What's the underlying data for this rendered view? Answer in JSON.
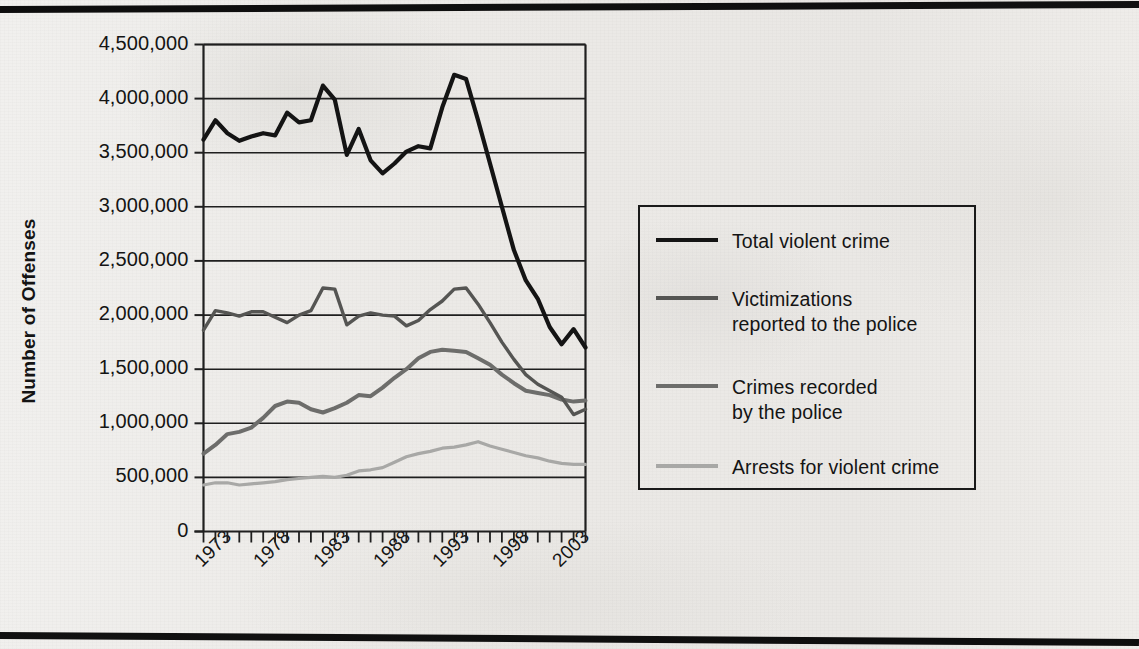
{
  "figure": {
    "y_axis_title": "Number of Offenses"
  },
  "chart_data": {
    "type": "line",
    "title": "",
    "xlabel": "",
    "ylabel": "Number of Offenses",
    "xlim": [
      1973,
      2005
    ],
    "ylim": [
      0,
      4500000
    ],
    "grid": "horizontal",
    "legend_position": "right",
    "y_ticks": [
      "0",
      "500,000",
      "1,000,000",
      "1,500,000",
      "2,000,000",
      "2,500,000",
      "3,000,000",
      "3,500,000",
      "4,000,000",
      "4,500,000"
    ],
    "y_tick_values": [
      0,
      500000,
      1000000,
      1500000,
      2000000,
      2500000,
      3000000,
      3500000,
      4000000,
      4500000
    ],
    "x_ticks": [
      "1973",
      "1978",
      "1983",
      "1988",
      "1993",
      "1998",
      "2003"
    ],
    "x_tick_values": [
      1973,
      1978,
      1983,
      1988,
      1993,
      1998,
      2003
    ],
    "x_minor_tick_interval": 1,
    "x": [
      1973,
      1974,
      1975,
      1976,
      1977,
      1978,
      1979,
      1980,
      1981,
      1982,
      1983,
      1984,
      1985,
      1986,
      1987,
      1988,
      1989,
      1990,
      1991,
      1992,
      1993,
      1994,
      1995,
      1996,
      1997,
      1998,
      1999,
      2000,
      2001,
      2002,
      2003,
      2004,
      2005
    ],
    "series": [
      {
        "name": "Total violent crime",
        "color": "#141414",
        "width": 4.2,
        "values": [
          3620000,
          3800000,
          3680000,
          3610000,
          3650000,
          3680000,
          3660000,
          3870000,
          3780000,
          3800000,
          4120000,
          3990000,
          3480000,
          3720000,
          3430000,
          3310000,
          3400000,
          3510000,
          3560000,
          3540000,
          3920000,
          4220000,
          4180000,
          3800000,
          3400000,
          3000000,
          2600000,
          2320000,
          2150000,
          1890000,
          1730000,
          1870000,
          1700000
        ]
      },
      {
        "name": "Victimizations reported to the police",
        "color": "#555553",
        "width": 3.4,
        "values": [
          1860000,
          2040000,
          2020000,
          1990000,
          2030000,
          2030000,
          1980000,
          1930000,
          2000000,
          2040000,
          2250000,
          2240000,
          1910000,
          1990000,
          2020000,
          2000000,
          1990000,
          1900000,
          1950000,
          2050000,
          2130000,
          2240000,
          2250000,
          2100000,
          1930000,
          1750000,
          1590000,
          1450000,
          1360000,
          1300000,
          1240000,
          1080000,
          1130000
        ]
      },
      {
        "name": "Crimes recorded by the police",
        "color": "#6d6d6b",
        "width": 4.0,
        "values": [
          720000,
          800000,
          900000,
          920000,
          960000,
          1050000,
          1160000,
          1200000,
          1190000,
          1130000,
          1100000,
          1140000,
          1190000,
          1260000,
          1250000,
          1330000,
          1420000,
          1500000,
          1600000,
          1660000,
          1680000,
          1670000,
          1660000,
          1600000,
          1540000,
          1450000,
          1370000,
          1300000,
          1280000,
          1260000,
          1220000,
          1200000,
          1210000
        ]
      },
      {
        "name": "Arrests for violent crime",
        "color": "#a8a8a6",
        "width": 3.2,
        "values": [
          430000,
          450000,
          450000,
          430000,
          440000,
          450000,
          460000,
          480000,
          490000,
          500000,
          510000,
          500000,
          520000,
          560000,
          570000,
          590000,
          640000,
          690000,
          720000,
          740000,
          770000,
          780000,
          800000,
          830000,
          790000,
          760000,
          730000,
          700000,
          680000,
          650000,
          630000,
          620000,
          620000
        ]
      }
    ]
  },
  "legend": {
    "entries": [
      {
        "label_line1": "Total violent crime",
        "label_line2": ""
      },
      {
        "label_line1": "Victimizations",
        "label_line2": "reported to the police"
      },
      {
        "label_line1": "Crimes recorded",
        "label_line2": "by the police"
      },
      {
        "label_line1": "Arrests for violent crime",
        "label_line2": ""
      }
    ]
  }
}
